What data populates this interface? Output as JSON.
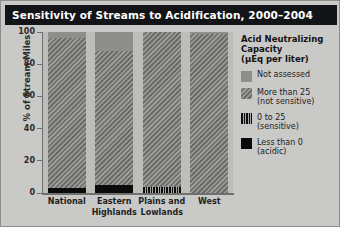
{
  "title": "Sensitivity of Streams to Acidification, 2000–2004",
  "legend": {
    "heading_line1": "Acid Neutralizing",
    "heading_line2": "Capacity",
    "heading_line3": "(µEq per liter)",
    "items": [
      {
        "swatch": "solid-gray-swatch",
        "line1": "Not assessed",
        "line2": "",
        "color": "#8e8e8c"
      },
      {
        "swatch": "diagonal-hatch-swatch",
        "line1": "More than 25",
        "line2": "(not sensitive)",
        "color": "#848481"
      },
      {
        "swatch": "vertical-stripe-swatch",
        "line1": "0 to 25",
        "line2": "(sensitive)",
        "color": "#0d0d0d"
      },
      {
        "swatch": "solid-black-swatch",
        "line1": "Less than 0",
        "line2": "(acidic)",
        "color": "#0b0b0b"
      }
    ]
  },
  "chart_data": {
    "type": "bar",
    "stacked": true,
    "title": "Sensitivity of Streams to Acidification, 2000–2004",
    "xlabel": "",
    "ylabel": "% of Stream Miles",
    "ylim": [
      0,
      100
    ],
    "yticks": [
      0,
      20,
      40,
      60,
      80,
      100
    ],
    "ytick_labels": [
      "0",
      "20",
      "40",
      "60",
      "80",
      "100"
    ],
    "grid": false,
    "legend_position": "right",
    "categories": [
      "National",
      "Eastern Highlands",
      "Plains and Lowlands",
      "West"
    ],
    "category_label_lines": [
      [
        "National",
        ""
      ],
      [
        "Eastern",
        "Highlands"
      ],
      [
        "Plains and",
        "Lowlands"
      ],
      [
        "West",
        ""
      ]
    ],
    "series": [
      {
        "name": "Less than 0 (acidic)",
        "key": "less",
        "values": [
          3,
          5,
          0,
          0
        ]
      },
      {
        "name": "0 to 25 (sensitive)",
        "key": "s0to25",
        "values": [
          0,
          0,
          4,
          0
        ]
      },
      {
        "name": "More than 25 (not sensitive)",
        "key": "more",
        "values": [
          93,
          83,
          96,
          99
        ]
      },
      {
        "name": "Not assessed",
        "key": "na",
        "values": [
          4,
          12,
          0,
          1
        ]
      }
    ]
  }
}
